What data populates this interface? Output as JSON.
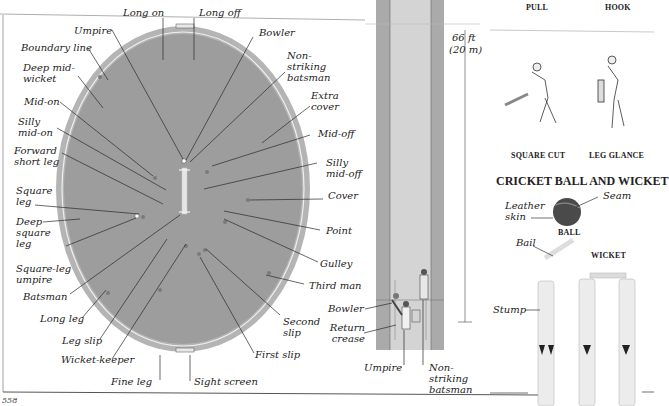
{
  "page": {
    "number": "558"
  },
  "colors": {
    "field": "#9c9c9c",
    "boundary_ring": "#b4b4b4",
    "boundary_line": "#ececec",
    "pitch": "#d0d0d0",
    "pitch_edge": "#a8a8a8",
    "text": "#222222"
  },
  "field": {
    "labels": {
      "long_on": "Long on",
      "long_off": "Long off",
      "umpire": "Umpire",
      "bowler": "Bowler",
      "boundary_line": "Boundary line",
      "non_striking_batsman": "Non-striking batsman",
      "deep_mid_wicket": "Deep mid-wicket",
      "extra_cover": "Extra cover",
      "mid_on": "Mid-on",
      "mid_off": "Mid-off",
      "silly_mid_on": "Silly mid-on",
      "silly_mid_off": "Silly mid-off",
      "forward_short_leg": "Forward short leg",
      "cover": "Cover",
      "square_leg": "Square leg",
      "point": "Point",
      "deep_square_leg": "Deep square leg",
      "gulley": "Gulley",
      "square_leg_umpire": "Square-leg umpire",
      "third_man": "Third man",
      "batsman": "Batsman",
      "long_leg": "Long leg",
      "second_slip": "Second slip",
      "leg_slip": "Leg slip",
      "first_slip": "First slip",
      "wicket_keeper": "Wicket-keeper",
      "fine_leg": "Fine leg",
      "sight_screen": "Sight screen"
    }
  },
  "pitch": {
    "length_label": "66 ft",
    "length_metric": "(20 m)",
    "labels": {
      "bowler": "Bowler",
      "return_crease": "Return crease",
      "umpire": "Umpire",
      "non_striking_batsman": "Non-striking batsman"
    }
  },
  "shots": {
    "captions": [
      "PULL",
      "HOOK",
      "SQUARE CUT",
      "LEG GLANCE"
    ]
  },
  "equipment": {
    "title": "CRICKET BALL AND WICKET",
    "ball_caption": "BALL",
    "wicket_caption": "WICKET",
    "labels": {
      "seam": "Seam",
      "leather_skin": "Leather skin",
      "bail": "Bail",
      "stump": "Stump"
    }
  }
}
